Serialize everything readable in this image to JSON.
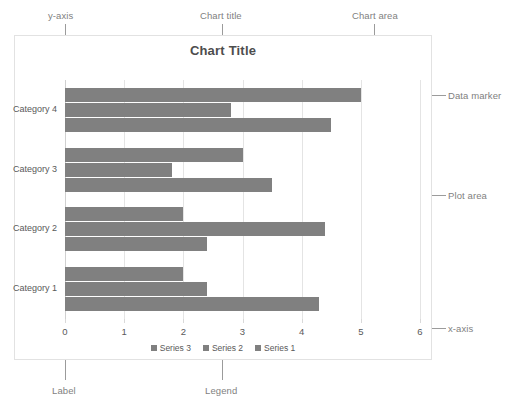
{
  "chart_data": {
    "type": "bar",
    "orientation": "horizontal",
    "title": "Chart Title",
    "categories": [
      "Category 1",
      "Category 2",
      "Category 3",
      "Category 4"
    ],
    "series": [
      {
        "name": "Series 1",
        "values": [
          4.3,
          2.4,
          3.5,
          4.5
        ]
      },
      {
        "name": "Series 2",
        "values": [
          2.4,
          4.4,
          1.8,
          2.8
        ]
      },
      {
        "name": "Series 3",
        "values": [
          2.0,
          2.0,
          3.0,
          5.0
        ]
      }
    ],
    "xlabel": "",
    "ylabel": "",
    "xlim": [
      0,
      6
    ],
    "xticks": [
      "0",
      "1",
      "2",
      "3",
      "4",
      "5",
      "6"
    ],
    "grid": true,
    "legend_position": "bottom",
    "legend_order": [
      "Series 3",
      "Series 2",
      "Series 1"
    ],
    "bar_color": "#808080"
  },
  "annotations": {
    "y_axis": "y-axis",
    "chart_title": "Chart title",
    "chart_area": "Chart area",
    "data_marker": "Data marker",
    "plot_area": "Plot area",
    "x_axis": "x-axis",
    "label": "Label",
    "legend": "Legend"
  },
  "colors": {
    "bar": "#808080",
    "gridline": "#e4e4e4",
    "chart_border": "#e2e2e2",
    "annotation_text": "#7f7f7f",
    "leader_line": "#9b9b9b",
    "text": "#595959"
  }
}
